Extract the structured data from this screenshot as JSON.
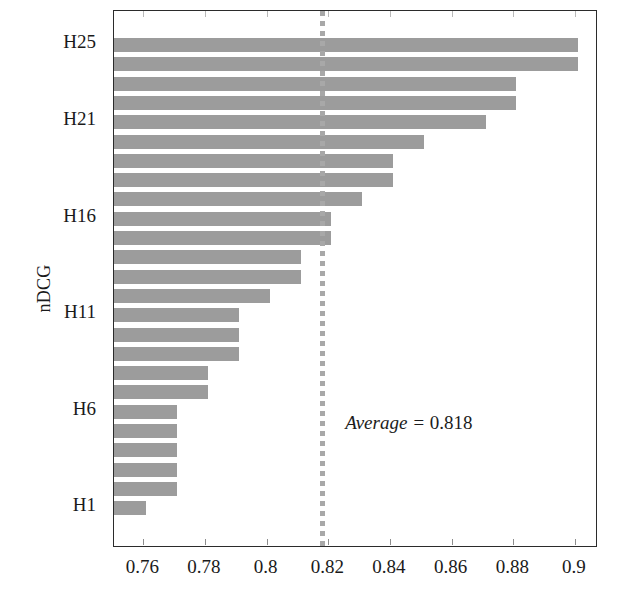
{
  "chart_data": {
    "type": "bar",
    "orientation": "horizontal",
    "title": "",
    "xlabel": "",
    "ylabel": "nDCG",
    "xlim": [
      0.7505,
      0.9065
    ],
    "grid": false,
    "legend": null,
    "bar_color": "#9c9c9c",
    "axis_color": "#2b2b2b",
    "xticks": [
      "0.76",
      "0.78",
      "0.8",
      "0.82",
      "0.84",
      "0.86",
      "0.88",
      "0.9"
    ],
    "xtick_values": [
      0.76,
      0.78,
      0.8,
      0.82,
      0.84,
      0.86,
      0.88,
      0.9
    ],
    "ytick_labels": [
      "H25",
      "H21",
      "H16",
      "H11",
      "H6",
      "H1"
    ],
    "categories": [
      "H25",
      "H24",
      "H23",
      "H22",
      "H21",
      "H20",
      "H19",
      "H18",
      "H17",
      "H16",
      "H15",
      "H14",
      "H13",
      "H12",
      "H11",
      "H10",
      "H9",
      "H8",
      "H7",
      "H6",
      "H5",
      "H4",
      "H3",
      "H2",
      "H1"
    ],
    "values": [
      0.901,
      0.901,
      0.881,
      0.881,
      0.871,
      0.851,
      0.841,
      0.841,
      0.831,
      0.821,
      0.821,
      0.811,
      0.811,
      0.801,
      0.791,
      0.791,
      0.791,
      0.781,
      0.781,
      0.771,
      0.771,
      0.771,
      0.771,
      0.771,
      0.761
    ],
    "annotations": [
      {
        "name": "average-line",
        "type": "vline",
        "value": 0.818,
        "style": "dotted",
        "color": "#a8a8a8",
        "label": "Average = 0.818",
        "label_prefix": "Average = ",
        "label_value": "0.818"
      }
    ]
  },
  "axis": {
    "y_title": "nDCG"
  }
}
